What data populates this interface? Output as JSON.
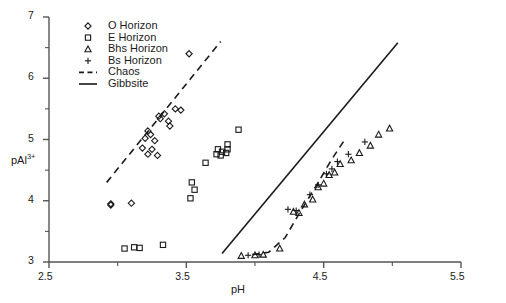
{
  "chart_data": {
    "type": "scatter",
    "title": "",
    "xlabel": "pH",
    "ylabel": "pAl3+",
    "ylabel_base": "pAl",
    "ylabel_sup": "3+",
    "xlim": [
      2.5,
      5.5
    ],
    "ylim": [
      3,
      7
    ],
    "xticks": [
      2.5,
      3.5,
      4.5,
      5.5
    ],
    "xtick_labels": [
      "2.5",
      "3.5",
      "4.5",
      "5.5"
    ],
    "xminorticks": [
      3.0,
      4.0,
      5.0
    ],
    "yticks": [
      3,
      4,
      5,
      6,
      7
    ],
    "ytick_labels": [
      "3",
      "4",
      "5",
      "6",
      "7"
    ],
    "yminorticks": [
      3.5,
      4.5,
      5.5,
      6.5
    ],
    "grid": false,
    "legend_position": "top-left",
    "series": [
      {
        "name": "O Horizon",
        "marker": "diamond",
        "points": [
          [
            3.52,
            6.4
          ],
          [
            3.42,
            5.5
          ],
          [
            3.46,
            5.48
          ],
          [
            3.34,
            5.42
          ],
          [
            3.37,
            5.3
          ],
          [
            3.3,
            5.38
          ],
          [
            3.31,
            5.34
          ],
          [
            3.38,
            5.22
          ],
          [
            3.22,
            5.14
          ],
          [
            3.24,
            5.08
          ],
          [
            3.2,
            5.02
          ],
          [
            3.27,
            4.98
          ],
          [
            3.18,
            4.86
          ],
          [
            3.25,
            4.84
          ],
          [
            3.22,
            4.76
          ],
          [
            3.29,
            4.74
          ],
          [
            2.95,
            3.95
          ],
          [
            2.95,
            3.93
          ],
          [
            3.1,
            3.96
          ]
        ]
      },
      {
        "name": "E Horizon",
        "marker": "square",
        "points": [
          [
            3.88,
            5.16
          ],
          [
            3.8,
            4.92
          ],
          [
            3.73,
            4.84
          ],
          [
            3.76,
            4.8
          ],
          [
            3.8,
            4.84
          ],
          [
            3.72,
            4.76
          ],
          [
            3.75,
            4.74
          ],
          [
            3.79,
            4.78
          ],
          [
            3.64,
            4.62
          ],
          [
            3.54,
            4.3
          ],
          [
            3.56,
            4.18
          ],
          [
            3.53,
            4.04
          ],
          [
            3.05,
            3.22
          ],
          [
            3.12,
            3.24
          ],
          [
            3.16,
            3.23
          ],
          [
            3.33,
            3.28
          ]
        ]
      },
      {
        "name": "Bhs Horizon",
        "marker": "triangle",
        "points": [
          [
            3.9,
            3.1
          ],
          [
            4.0,
            3.11
          ],
          [
            4.06,
            3.12
          ],
          [
            4.18,
            3.22
          ],
          [
            4.28,
            3.82
          ],
          [
            4.32,
            3.8
          ],
          [
            4.36,
            3.94
          ],
          [
            4.42,
            4.02
          ],
          [
            4.46,
            4.22
          ],
          [
            4.5,
            4.28
          ],
          [
            4.54,
            4.42
          ],
          [
            4.58,
            4.46
          ],
          [
            4.62,
            4.6
          ],
          [
            4.7,
            4.66
          ],
          [
            4.76,
            4.78
          ],
          [
            4.84,
            4.9
          ],
          [
            4.9,
            5.08
          ],
          [
            4.98,
            5.18
          ]
        ]
      },
      {
        "name": "Bs Horizon",
        "marker": "plus",
        "points": [
          [
            3.95,
            3.11
          ],
          [
            4.03,
            3.12
          ],
          [
            4.24,
            3.86
          ],
          [
            4.3,
            3.84
          ],
          [
            4.4,
            4.1
          ],
          [
            4.46,
            4.26
          ],
          [
            4.52,
            4.44
          ],
          [
            4.56,
            4.52
          ],
          [
            4.6,
            4.64
          ],
          [
            4.68,
            4.76
          ],
          [
            4.8,
            4.96
          ]
        ]
      }
    ],
    "lines": [
      {
        "name": "Chaos",
        "style": "dashed",
        "segments": [
          [
            [
              2.92,
              4.3
            ],
            [
              3.75,
              6.6
            ]
          ]
        ]
      },
      {
        "name": "Chaos",
        "style": "dashed",
        "segments": [
          [
            [
              3.98,
              3.12
            ],
            [
              4.1,
              3.16
            ],
            [
              4.22,
              3.4
            ],
            [
              4.34,
              3.86
            ],
            [
              4.46,
              4.3
            ],
            [
              4.56,
              4.68
            ],
            [
              4.66,
              5.02
            ]
          ]
        ]
      },
      {
        "name": "Gibbsite",
        "style": "solid",
        "segments": [
          [
            [
              3.76,
              3.14
            ],
            [
              5.04,
              6.58
            ]
          ]
        ]
      }
    ],
    "legend": [
      {
        "label": "O Horizon",
        "marker": "diamond"
      },
      {
        "label": "E Horizon",
        "marker": "square"
      },
      {
        "label": "Bhs Horizon",
        "marker": "triangle"
      },
      {
        "label": "Bs Horizon",
        "marker": "plus"
      },
      {
        "label": "Chaos",
        "marker": "dashed-line"
      },
      {
        "label": "Gibbsite",
        "marker": "solid-line"
      }
    ]
  },
  "colors": {
    "axis": "#555555",
    "marker": "#1a1a1a",
    "line": "#1a1a1a",
    "background": "#ffffff"
  }
}
